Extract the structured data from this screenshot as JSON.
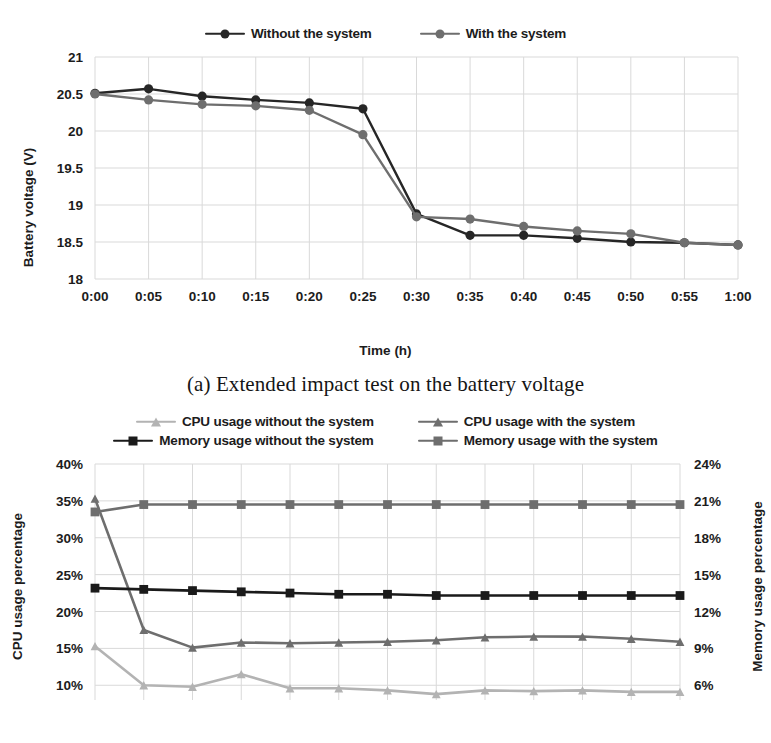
{
  "figures": [
    {
      "id": "a",
      "caption": "(a) Extended impact test on the battery voltage",
      "legend": [
        {
          "label": "Without the system",
          "color": "#262626",
          "marker": "circle"
        },
        {
          "label": "With the system",
          "color": "#6e6e6e",
          "marker": "circle"
        }
      ],
      "chart_data": {
        "type": "line",
        "title": "",
        "xlabel": "Time (h)",
        "ylabel": "Battery voltage (V)",
        "categories": [
          "0:00",
          "0:05",
          "0:10",
          "0:15",
          "0:20",
          "0:25",
          "0:30",
          "0:35",
          "0:40",
          "0:45",
          "0:50",
          "0:55",
          "1:00"
        ],
        "yticks": [
          18,
          18.5,
          19,
          19.5,
          20,
          20.5,
          21
        ],
        "ytick_labels": [
          "18",
          "18.5",
          "19",
          "19.5",
          "20",
          "20.5",
          "21"
        ],
        "ylim": [
          18,
          21
        ],
        "grid": true,
        "legend_position": "top-center",
        "series": [
          {
            "name": "Without the system",
            "color": "#262626",
            "marker": "circle",
            "values": [
              20.51,
              20.57,
              20.47,
              20.42,
              20.38,
              20.3,
              18.88,
              18.59,
              18.59,
              18.55,
              18.5,
              18.49,
              18.46
            ]
          },
          {
            "name": "With the system",
            "color": "#6e6e6e",
            "marker": "circle",
            "values": [
              20.5,
              20.42,
              20.36,
              20.34,
              20.28,
              19.95,
              18.84,
              18.81,
              18.71,
              18.65,
              18.61,
              18.49,
              18.46
            ]
          }
        ]
      }
    },
    {
      "id": "b",
      "caption": "",
      "legend": [
        {
          "label": "CPU usage without the system",
          "color": "#b3b3b3",
          "marker": "triangle"
        },
        {
          "label": "CPU usage with the system",
          "color": "#6e6e6e",
          "marker": "triangle"
        },
        {
          "label": "Memory usage without the system",
          "color": "#1a1a1a",
          "marker": "square"
        },
        {
          "label": "Memory usage with the system",
          "color": "#6e6e6e",
          "marker": "square"
        }
      ],
      "chart_data": {
        "type": "line",
        "title": "",
        "xlabel": "",
        "ylabel": "CPU usage percentage",
        "y2label": "Memory usage percentage",
        "categories": [
          "0:00",
          "0:05",
          "0:10",
          "0:15",
          "0:20",
          "0:25",
          "0:30",
          "0:35",
          "0:40",
          "0:45",
          "0:50",
          "0:55",
          "1:00"
        ],
        "yticks": [
          10,
          15,
          20,
          25,
          30,
          35,
          40
        ],
        "ytick_labels": [
          "10%",
          "15%",
          "20%",
          "25%",
          "30%",
          "35%",
          "40%"
        ],
        "ylim": [
          8,
          40
        ],
        "y2ticks": [
          6,
          9,
          12,
          15,
          18,
          21,
          24
        ],
        "y2tick_labels": [
          "6%",
          "9%",
          "12%",
          "15%",
          "18%",
          "21%",
          "24%"
        ],
        "y2lim": [
          4.8,
          24
        ],
        "grid": true,
        "legend_position": "top-center",
        "series": [
          {
            "name": "CPU usage without the system",
            "axis": "left",
            "color": "#b3b3b3",
            "marker": "triangle",
            "values": [
              15.3,
              10.0,
              9.8,
              11.5,
              9.6,
              9.6,
              9.3,
              8.8,
              9.3,
              9.2,
              9.3,
              9.1,
              9.1
            ]
          },
          {
            "name": "CPU usage with the system",
            "axis": "left",
            "color": "#6e6e6e",
            "marker": "triangle",
            "values": [
              35.3,
              17.5,
              15.1,
              15.8,
              15.7,
              15.8,
              15.9,
              16.1,
              16.5,
              16.6,
              16.6,
              16.3,
              15.9
            ]
          },
          {
            "name": "Memory usage without the system",
            "axis": "right",
            "color": "#1a1a1a",
            "marker": "square",
            "values": [
              13.9,
              13.8,
              13.7,
              13.6,
              13.5,
              13.4,
              13.4,
              13.3,
              13.3,
              13.3,
              13.3,
              13.3,
              13.3
            ]
          },
          {
            "name": "Memory usage with the system",
            "axis": "right",
            "color": "#6e6e6e",
            "marker": "square",
            "values": [
              20.1,
              20.7,
              20.7,
              20.7,
              20.7,
              20.7,
              20.7,
              20.7,
              20.7,
              20.7,
              20.7,
              20.7,
              20.7
            ]
          }
        ]
      }
    }
  ]
}
